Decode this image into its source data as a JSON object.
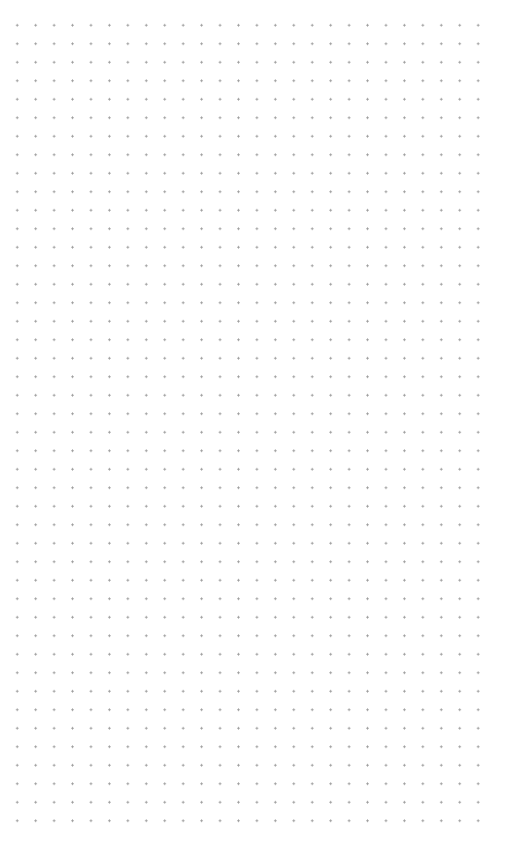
{
  "canvas": {
    "type": "dot-grid",
    "background_color": "#ffffff",
    "dot_color": "#9a9a9a",
    "columns": 26,
    "rows": 44,
    "spacing_px": 18.5
  }
}
